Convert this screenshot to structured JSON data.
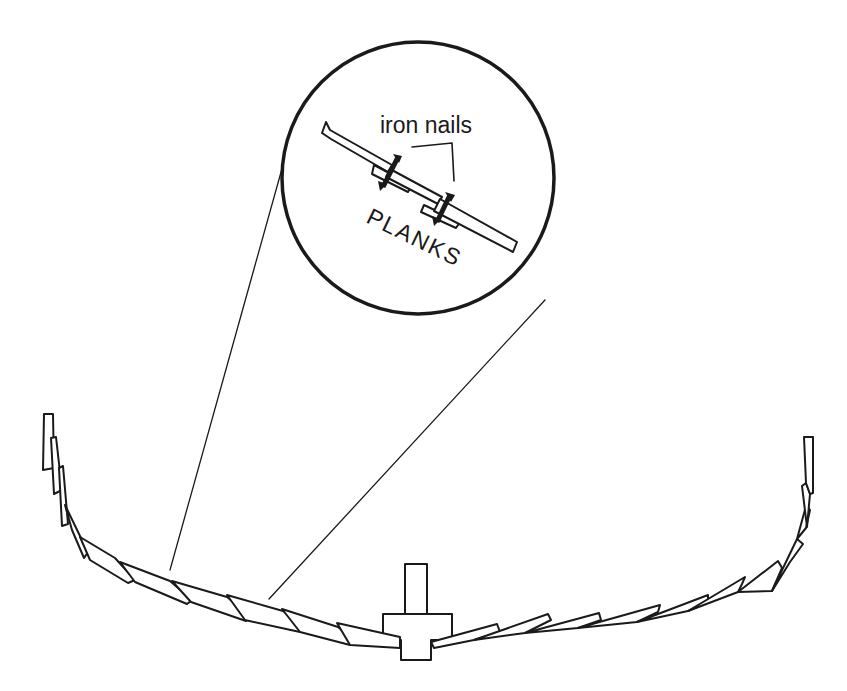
{
  "diagram": {
    "type": "cross-section",
    "inset": {
      "labels": {
        "nails": "iron nails",
        "planks": "PLANKS"
      }
    },
    "colors": {
      "ink": "#1a1a1a",
      "background": "#ffffff"
    }
  }
}
